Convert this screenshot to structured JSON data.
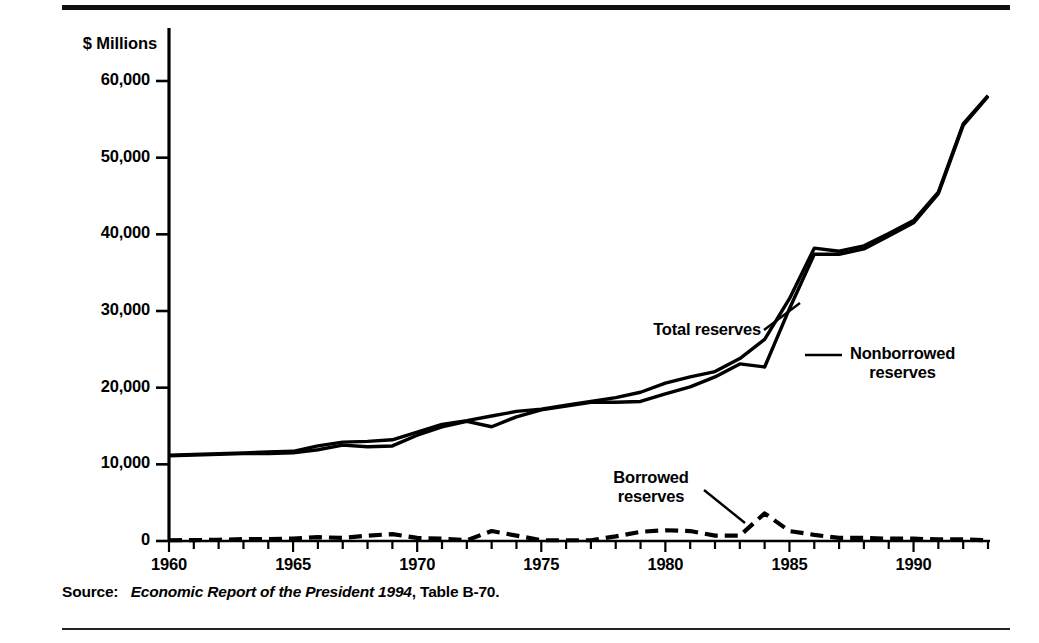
{
  "figure": {
    "axis_units_label": "$ Millions",
    "source_prefix": "Source:",
    "source_title": "Economic Report of the President 1994",
    "source_suffix": ", Table B-70."
  },
  "annotations": {
    "total": "Total reserves",
    "nonborrowed_line1": "Nonborrowed",
    "nonborrowed_line2": "reserves",
    "borrowed_line1": "Borrowed",
    "borrowed_line2": "reserves"
  },
  "colors": {
    "ink": "#000000",
    "background": "#ffffff",
    "rule": "#111111"
  },
  "chart_data": {
    "type": "line",
    "title": "",
    "xlabel": "",
    "ylabel": "$ Millions",
    "xlim": [
      1960,
      1993
    ],
    "ylim": [
      0,
      65000
    ],
    "grid": false,
    "legend": "annotated-inline",
    "xtick_labels": [
      "1960",
      "1965",
      "1970",
      "1975",
      "1980",
      "1985",
      "1990"
    ],
    "xticks": [
      1960,
      1965,
      1970,
      1975,
      1980,
      1985,
      1990
    ],
    "ytick_labels": [
      "0",
      "10,000",
      "20,000",
      "30,000",
      "40,000",
      "50,000",
      "60,000"
    ],
    "yticks": [
      0,
      10000,
      20000,
      30000,
      40000,
      50000,
      60000
    ],
    "minor_xtick_interval": 1,
    "x": [
      1960,
      1961,
      1962,
      1963,
      1964,
      1965,
      1966,
      1967,
      1968,
      1969,
      1970,
      1971,
      1972,
      1973,
      1974,
      1975,
      1976,
      1977,
      1978,
      1979,
      1980,
      1981,
      1982,
      1983,
      1984,
      1985,
      1986,
      1987,
      1988,
      1989,
      1990,
      1991,
      1992,
      1993
    ],
    "series": [
      {
        "name": "Total reserves",
        "style": "solid",
        "values": [
          11200,
          11300,
          11400,
          11500,
          11600,
          11700,
          12400,
          12900,
          13000,
          13200,
          14200,
          15200,
          15700,
          16300,
          16900,
          17200,
          17700,
          18200,
          18700,
          19400,
          20600,
          21400,
          22100,
          23800,
          26300,
          31600,
          38200,
          37800,
          38500,
          40100,
          41800,
          45500,
          54400,
          58100
        ]
      },
      {
        "name": "Nonborrowed reserves",
        "style": "solid",
        "values": [
          11100,
          11200,
          11300,
          11400,
          11400,
          11500,
          11900,
          12500,
          12300,
          12400,
          13800,
          14900,
          15600,
          14900,
          16200,
          17100,
          17600,
          18100,
          18100,
          18200,
          19200,
          20100,
          21400,
          23100,
          22700,
          30300,
          37400,
          37400,
          38100,
          39800,
          41500,
          45300,
          54200,
          58000
        ]
      },
      {
        "name": "Borrowed reserves",
        "style": "dashed",
        "values": [
          100,
          120,
          160,
          240,
          260,
          320,
          500,
          400,
          700,
          900,
          400,
          300,
          100,
          1300,
          700,
          100,
          100,
          100,
          600,
          1200,
          1400,
          1300,
          700,
          700,
          3600,
          1300,
          800,
          400,
          400,
          300,
          300,
          200,
          200,
          100
        ]
      }
    ]
  }
}
